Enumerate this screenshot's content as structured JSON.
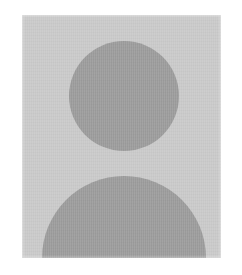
{
  "image": {
    "kind": "avatar-placeholder",
    "description": "Generic default user profile avatar: dark gray head circle above dark gray shoulders semicircle on a light gray square panel",
    "alt_text": "Default profile picture placeholder",
    "width": 242,
    "height": 275
  },
  "canvas": {
    "background_color": "#ffffff",
    "width_px": 242,
    "height_px": 275
  },
  "panel": {
    "name": "avatar-frame",
    "fill_color": "#c9c9c9",
    "x": 22,
    "y": 15,
    "width": 199,
    "height": 243
  },
  "shapes": {
    "head": {
      "name": "head-circle",
      "fill_color": "#9b9b9b",
      "center_x": 124,
      "center_y": 96,
      "radius": 55
    },
    "body": {
      "name": "shoulders-semicircle",
      "fill_color": "#9b9b9b",
      "center_x": 124,
      "center_y": 258,
      "radius": 82,
      "top_y": 162
    }
  },
  "palette": {
    "page_white": "#ffffff",
    "panel_gray": "#c9c9c9",
    "figure_gray": "#9b9b9b"
  }
}
